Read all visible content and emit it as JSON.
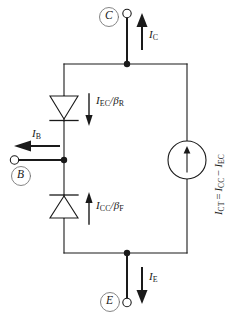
{
  "diagram": {
    "stroke_color": "#1a1a1a",
    "background": "#ffffff"
  },
  "terminals": {
    "collector": {
      "label": "C",
      "name": "collector-terminal"
    },
    "base": {
      "label": "B",
      "name": "base-terminal"
    },
    "emitter": {
      "label": "E",
      "name": "emitter-terminal"
    }
  },
  "currents": {
    "collector": {
      "symbol": "I",
      "subscript": "C"
    },
    "base": {
      "symbol": "I",
      "subscript": "B"
    },
    "emitter": {
      "symbol": "I",
      "subscript": "E"
    }
  },
  "components": {
    "reverse_diode": {
      "name": "reverse-diode",
      "numerator": "I",
      "numerator_sub": "EC",
      "denominator": "β",
      "denominator_sub": "R",
      "direction": "down"
    },
    "forward_diode": {
      "name": "forward-diode",
      "numerator": "I",
      "numerator_sub": "CC",
      "denominator": "β",
      "denominator_sub": "F",
      "direction": "up"
    },
    "current_source": {
      "name": "transport-current-source",
      "symbol": "I",
      "symbol_sub": "CT",
      "equals": "=",
      "term1": "I",
      "term1_sub": "CC",
      "minus": "−",
      "term2": "I",
      "term2_sub": "EC",
      "direction": "up"
    }
  }
}
